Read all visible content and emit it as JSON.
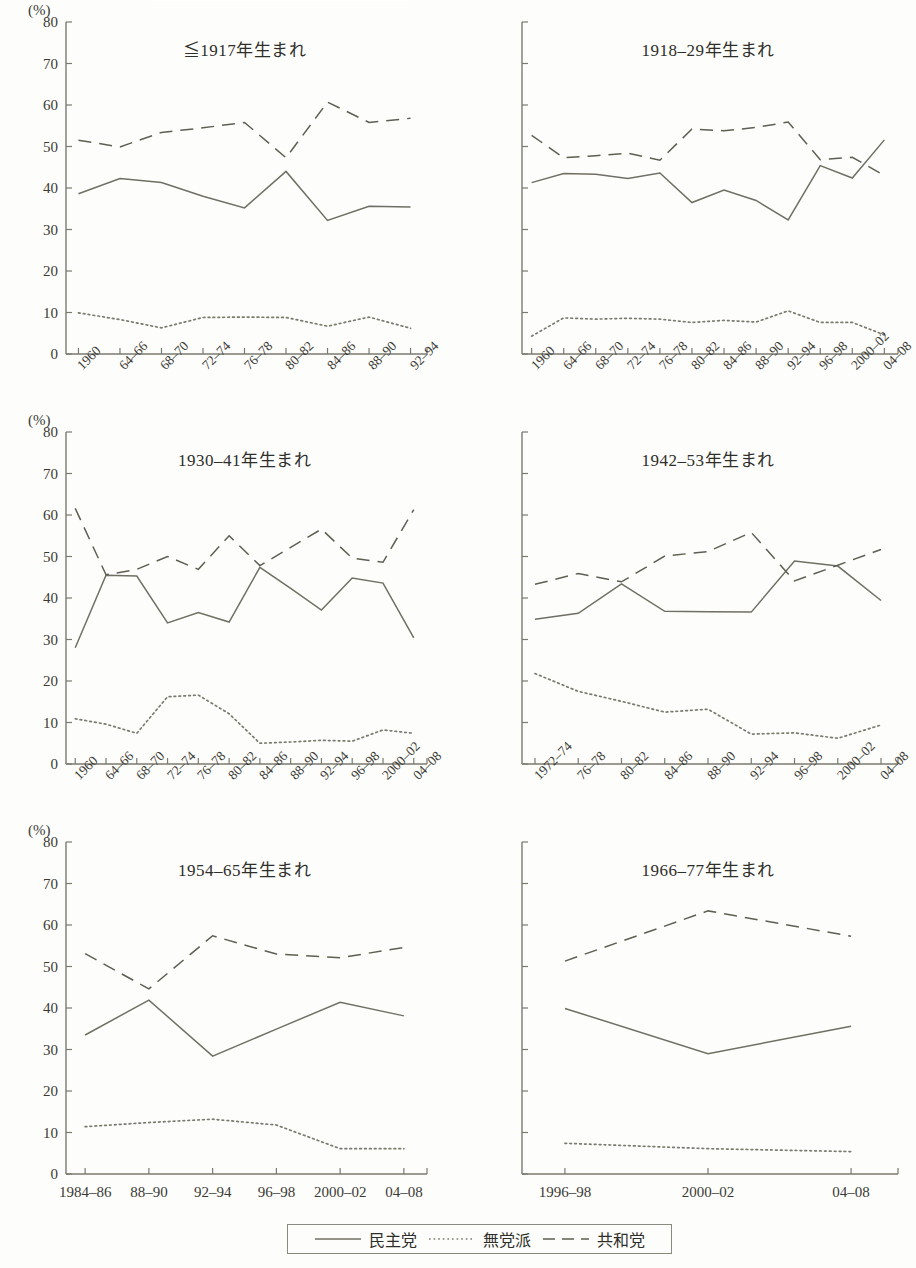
{
  "figure": {
    "unit_label": "(%)",
    "y_ticks": [
      0,
      10,
      20,
      30,
      40,
      50,
      60,
      70,
      80
    ],
    "series_names": {
      "democrat": "民主党",
      "independent": "無党派",
      "republican": "共和党"
    },
    "series_colors": {
      "democrat": "#6f6f63",
      "independent": "#7a7a6e",
      "republican": "#5e5e52",
      "axis": "#7a7a70",
      "text": "#3a3a35"
    },
    "legend": {
      "items": [
        {
          "label": "民主党",
          "style": "solid"
        },
        {
          "label": "無党派",
          "style": "dotted"
        },
        {
          "label": "共和党",
          "style": "dashed"
        }
      ]
    }
  },
  "chart_data": [
    {
      "type": "line",
      "title": "≦1917年生まれ",
      "xlabel": "",
      "ylabel": "(%)",
      "ylim": [
        0,
        80
      ],
      "grid": false,
      "legend_position": "bottom",
      "categories": [
        "1960",
        "64–66",
        "68–70",
        "72–74",
        "76–78",
        "80–82",
        "84–86",
        "88–90",
        "92–94"
      ],
      "series": [
        {
          "name": "民主党",
          "style": "solid",
          "values": [
            38.6,
            42.3,
            41.3,
            38.0,
            35.2,
            44.0,
            32.2,
            35.6,
            35.4
          ]
        },
        {
          "name": "無党派",
          "style": "dotted",
          "values": [
            9.9,
            8.3,
            6.3,
            8.8,
            8.9,
            8.8,
            6.7,
            8.9,
            6.2
          ]
        },
        {
          "name": "共和党",
          "style": "dashed",
          "values": [
            51.5,
            49.9,
            53.4,
            54.5,
            55.8,
            47.3,
            60.7,
            55.8,
            56.8
          ]
        }
      ]
    },
    {
      "type": "line",
      "title": "1918–29年生まれ",
      "xlabel": "",
      "ylabel": "(%)",
      "ylim": [
        0,
        80
      ],
      "grid": false,
      "legend_position": "bottom",
      "categories": [
        "1960",
        "64–66",
        "68–70",
        "72–74",
        "76–78",
        "80–82",
        "84–86",
        "88–90",
        "92–94",
        "96–98",
        "2000–02",
        "04–08"
      ],
      "series": [
        {
          "name": "民主党",
          "style": "solid",
          "values": [
            41.3,
            43.5,
            43.3,
            42.3,
            43.6,
            36.5,
            39.5,
            37.0,
            32.3,
            45.4,
            42.4,
            51.6
          ]
        },
        {
          "name": "無党派",
          "style": "dotted",
          "values": [
            4.3,
            8.7,
            8.4,
            8.6,
            8.4,
            7.6,
            8.1,
            7.7,
            10.4,
            7.6,
            7.6,
            4.6
          ]
        },
        {
          "name": "共和党",
          "style": "dashed",
          "values": [
            52.7,
            47.3,
            47.8,
            48.4,
            46.7,
            54.2,
            53.8,
            54.6,
            55.9,
            46.8,
            47.4,
            43.0
          ]
        }
      ]
    },
    {
      "type": "line",
      "title": "1930–41年生まれ",
      "xlabel": "",
      "ylabel": "(%)",
      "ylim": [
        0,
        80
      ],
      "grid": false,
      "legend_position": "bottom",
      "categories": [
        "1960",
        "64–66",
        "68–70",
        "72–74",
        "76–78",
        "80–82",
        "84–86",
        "88–90",
        "92–94",
        "96–98",
        "2000–02",
        "04–08"
      ],
      "series": [
        {
          "name": "民主党",
          "style": "solid",
          "values": [
            28.0,
            45.5,
            45.3,
            34.0,
            36.5,
            34.2,
            47.4,
            42.3,
            37.1,
            44.8,
            43.6,
            30.4
          ]
        },
        {
          "name": "無党派",
          "style": "dotted",
          "values": [
            10.9,
            9.6,
            7.4,
            16.2,
            16.6,
            12.1,
            5.0,
            5.3,
            5.7,
            5.5,
            8.2,
            7.4
          ]
        },
        {
          "name": "共和党",
          "style": "dashed",
          "values": [
            61.6,
            45.6,
            46.9,
            50.0,
            46.9,
            55.0,
            47.8,
            52.2,
            56.6,
            49.6,
            48.6,
            61.3
          ]
        }
      ]
    },
    {
      "type": "line",
      "title": "1942–53年生まれ",
      "xlabel": "",
      "ylabel": "(%)",
      "ylim": [
        0,
        80
      ],
      "grid": false,
      "legend_position": "bottom",
      "categories": [
        "1972–74",
        "76–78",
        "80–82",
        "84–86",
        "88–90",
        "92–94",
        "96–98",
        "2000–02",
        "04–08"
      ],
      "series": [
        {
          "name": "民主党",
          "style": "solid",
          "values": [
            34.9,
            36.3,
            43.4,
            36.8,
            36.7,
            36.6,
            48.9,
            47.7,
            39.4
          ]
        },
        {
          "name": "無党派",
          "style": "dotted",
          "values": [
            21.8,
            17.5,
            15.1,
            12.5,
            13.2,
            7.2,
            7.5,
            6.2,
            9.4
          ]
        },
        {
          "name": "共和党",
          "style": "dashed",
          "values": [
            43.3,
            45.9,
            43.9,
            50.1,
            51.2,
            55.8,
            44.1,
            47.9,
            51.7
          ]
        }
      ]
    },
    {
      "type": "line",
      "title": "1954–65年生まれ",
      "xlabel": "",
      "ylabel": "(%)",
      "ylim": [
        0,
        80
      ],
      "grid": false,
      "legend_position": "bottom",
      "categories": [
        "1984–86",
        "88–90",
        "92–94",
        "96–98",
        "2000–02",
        "04–08"
      ],
      "series": [
        {
          "name": "民主党",
          "style": "solid",
          "values": [
            33.5,
            41.9,
            28.4,
            34.9,
            41.4,
            38.1
          ]
        },
        {
          "name": "無党派",
          "style": "dotted",
          "values": [
            11.4,
            12.4,
            13.2,
            11.8,
            6.1,
            6.1
          ]
        },
        {
          "name": "共和党",
          "style": "dashed",
          "values": [
            53.1,
            44.6,
            57.4,
            53.0,
            52.1,
            54.6
          ]
        }
      ]
    },
    {
      "type": "line",
      "title": "1966–77年生まれ",
      "xlabel": "",
      "ylabel": "(%)",
      "ylim": [
        0,
        80
      ],
      "grid": false,
      "legend_position": "bottom",
      "categories": [
        "1996–98",
        "2000–02",
        "04–08"
      ],
      "series": [
        {
          "name": "民主党",
          "style": "solid",
          "values": [
            39.9,
            29.0,
            35.6
          ]
        },
        {
          "name": "無党派",
          "style": "dotted",
          "values": [
            7.4,
            6.1,
            5.4
          ]
        },
        {
          "name": "共和党",
          "style": "dashed",
          "values": [
            51.3,
            63.4,
            57.3
          ]
        }
      ]
    }
  ]
}
